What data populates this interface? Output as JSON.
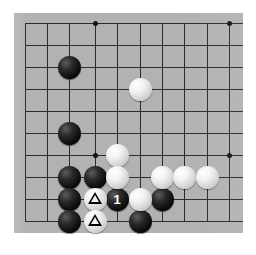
{
  "diagram": {
    "type": "go-board-diagram",
    "board_background_color": "#b2b2b2",
    "page_background_color": "#ffffff",
    "line_color": "#2b2b2b",
    "black_stone_color": "#0a0a0a",
    "white_stone_color": "#f2f2f2",
    "move_number_text_color": "#ffffff",
    "mark_color": "#000000"
  },
  "board": {
    "visible_columns": 10,
    "visible_rows": 10,
    "cell_size_px": 22.2,
    "origin_x_px": 11,
    "origin_y_px": 10,
    "grid_x": [
      11,
      33,
      55,
      81,
      103,
      126,
      148,
      170,
      193,
      215
    ],
    "grid_y": [
      10,
      32,
      54,
      76,
      98,
      120,
      142,
      164,
      186,
      208
    ],
    "star_points": [
      {
        "x": 81,
        "y": 10
      },
      {
        "x": 215,
        "y": 10
      },
      {
        "x": 81,
        "y": 142
      },
      {
        "x": 215,
        "y": 142
      }
    ]
  },
  "stones": [
    {
      "id": "b1",
      "color": "black",
      "x": 55,
      "y": 54,
      "label": "",
      "mark": ""
    },
    {
      "id": "b2",
      "color": "black",
      "x": 55,
      "y": 120,
      "label": "",
      "mark": ""
    },
    {
      "id": "b3",
      "color": "black",
      "x": 55,
      "y": 164,
      "label": "",
      "mark": ""
    },
    {
      "id": "b4",
      "color": "black",
      "x": 55,
      "y": 186,
      "label": "",
      "mark": ""
    },
    {
      "id": "b5",
      "color": "black",
      "x": 55,
      "y": 208,
      "label": "",
      "mark": ""
    },
    {
      "id": "b6",
      "color": "black",
      "x": 81,
      "y": 164,
      "label": "",
      "mark": ""
    },
    {
      "id": "b7",
      "color": "black",
      "x": 103,
      "y": 186,
      "label": "1",
      "mark": ""
    },
    {
      "id": "b8",
      "color": "black",
      "x": 148,
      "y": 186,
      "label": "",
      "mark": ""
    },
    {
      "id": "b9",
      "color": "black",
      "x": 126,
      "y": 208,
      "label": "",
      "mark": ""
    },
    {
      "id": "w1",
      "color": "white",
      "x": 126,
      "y": 76,
      "label": "",
      "mark": ""
    },
    {
      "id": "w2",
      "color": "white",
      "x": 103,
      "y": 142,
      "label": "",
      "mark": ""
    },
    {
      "id": "w3",
      "color": "white",
      "x": 103,
      "y": 164,
      "label": "",
      "mark": ""
    },
    {
      "id": "w4",
      "color": "white",
      "x": 148,
      "y": 164,
      "label": "",
      "mark": ""
    },
    {
      "id": "w5",
      "color": "white",
      "x": 170,
      "y": 164,
      "label": "",
      "mark": ""
    },
    {
      "id": "w6",
      "color": "white",
      "x": 193,
      "y": 164,
      "label": "",
      "mark": ""
    },
    {
      "id": "w7",
      "color": "white",
      "x": 126,
      "y": 186,
      "label": "",
      "mark": ""
    },
    {
      "id": "w8",
      "color": "white",
      "x": 81,
      "y": 186,
      "label": "",
      "mark": "triangle"
    },
    {
      "id": "w9",
      "color": "white",
      "x": 81,
      "y": 208,
      "label": "",
      "mark": "triangle"
    }
  ],
  "stone_diameter_px": 23,
  "moves": [
    {
      "number": "1",
      "color": "black",
      "x": 103,
      "y": 186
    }
  ],
  "marked_stones": [
    {
      "mark": "triangle",
      "color": "white",
      "x": 81,
      "y": 186
    },
    {
      "mark": "triangle",
      "color": "white",
      "x": 81,
      "y": 208
    }
  ]
}
